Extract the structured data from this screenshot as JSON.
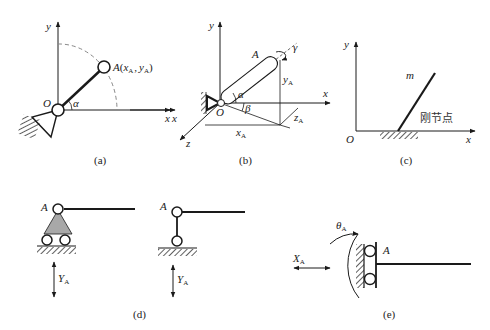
{
  "figure": {
    "panels": [
      {
        "id": "a",
        "caption": "(a)",
        "axes": {
          "x": "x",
          "y": "y"
        },
        "origin": "O",
        "angle": "α",
        "point": {
          "name": "A",
          "open": "(",
          "x": "x",
          "x_sub": "A",
          "sep": ",",
          "y": "y",
          "y_sub": "A",
          "close": ")"
        }
      },
      {
        "id": "b",
        "caption": "(b)",
        "axes": {
          "x": "x",
          "y": "y",
          "z": "z"
        },
        "origin": "O",
        "point": "A",
        "angles": {
          "alpha": "α",
          "beta": "β",
          "gamma": "γ"
        },
        "dims": {
          "x": "x",
          "x_sub": "A",
          "y": "y",
          "y_sub": "A",
          "z": "z",
          "z_sub": "A"
        },
        "left_axis_label": "x"
      },
      {
        "id": "c",
        "caption": "(c)",
        "axes": {
          "x": "x",
          "y": "y"
        },
        "origin": "O",
        "mass": "m",
        "joint_label": "刚节点"
      },
      {
        "id": "d",
        "caption": "(d)",
        "left": {
          "point": "A",
          "force": "Y",
          "force_sub": "A"
        },
        "right": {
          "point": "A",
          "force": "Y",
          "force_sub": "A"
        }
      },
      {
        "id": "e",
        "caption": "(e)",
        "point": "A",
        "force": "X",
        "force_sub": "A",
        "rotation": "θ",
        "rotation_sub": "A"
      }
    ]
  },
  "colors": {
    "line": "#1a1a1a",
    "dashed": "#777777",
    "support_fill": "#a8a8a8"
  }
}
